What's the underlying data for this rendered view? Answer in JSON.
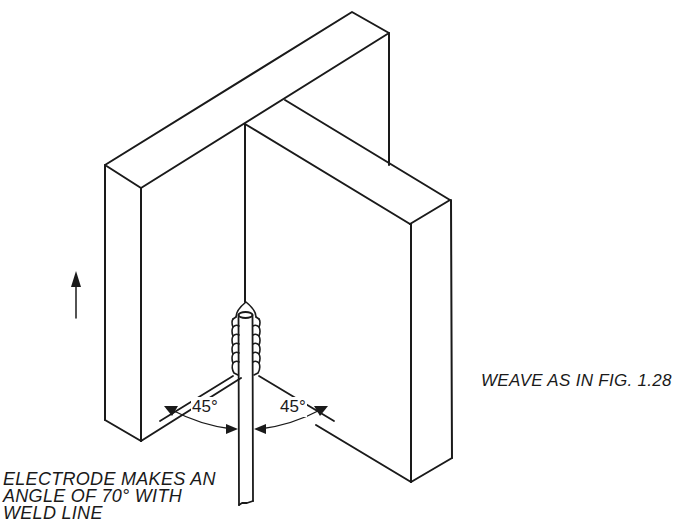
{
  "figure": {
    "type": "welding-diagram",
    "line_color": "#1a1a1a",
    "background": "#ffffff"
  },
  "labels": {
    "left_angle": "45°",
    "right_angle": "45°",
    "weave_note": "WEAVE AS IN FIG. 1.28",
    "electrode_note_line1": "ELECTRODE MAKES AN",
    "electrode_note_line2": "ANGLE OF 70° WITH",
    "electrode_note_line3": "WELD LINE"
  },
  "symbols": {
    "direction_arrow": "up-arrow-icon",
    "direction_meaning": "welding direction upward"
  }
}
